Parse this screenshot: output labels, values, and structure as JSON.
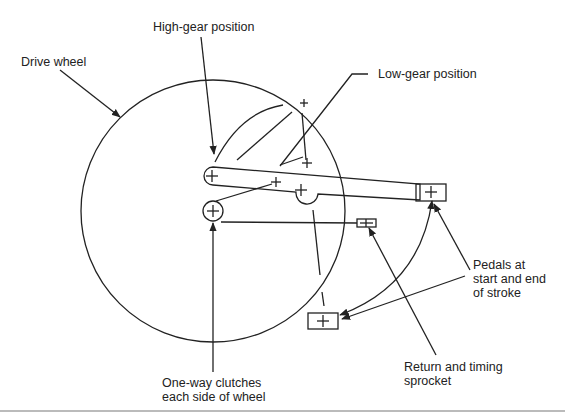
{
  "diagram": {
    "type": "mechanical-schematic",
    "labels": {
      "high_gear": "High-gear position",
      "drive_wheel": "Drive wheel",
      "low_gear": "Low-gear position",
      "pedals_line1": "Pedals at",
      "pedals_line2": "start and end",
      "pedals_line3": "of stroke",
      "sprocket_line1": "Return and timing",
      "sprocket_line2": "sprocket",
      "clutch_line1": "One-way clutches",
      "clutch_line2": "each side of wheel"
    },
    "colors": {
      "stroke": "#222222",
      "background": "#ffffff"
    }
  }
}
